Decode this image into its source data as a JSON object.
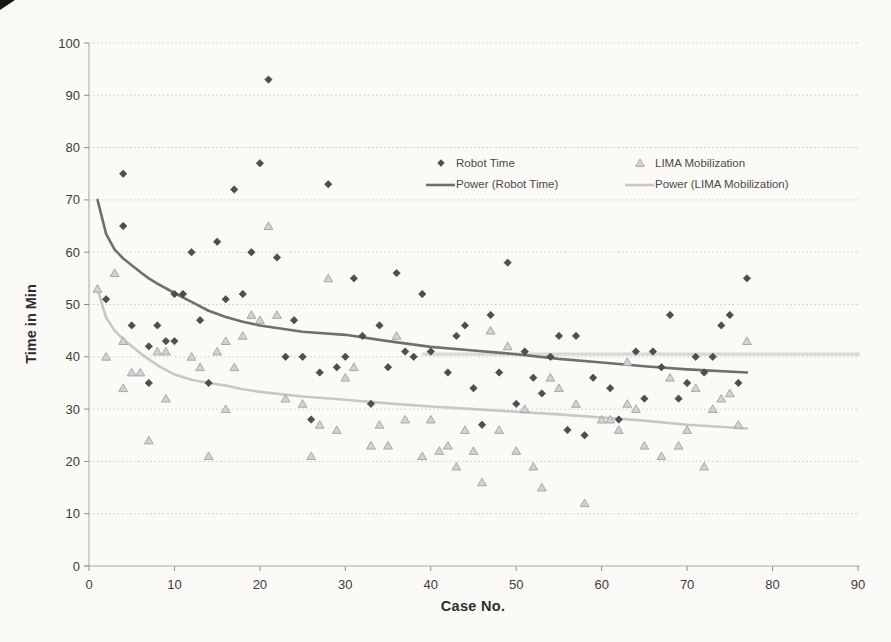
{
  "figure": {
    "background": "#fbfaf7",
    "scan_artifact": "black-corner-wedge-top-left"
  },
  "chart_data": {
    "type": "scatter",
    "title": "",
    "xlabel": "Case No.",
    "ylabel": "Time in Min",
    "xlim": [
      0,
      90
    ],
    "ylim": [
      0,
      100
    ],
    "x_ticks": [
      0,
      10,
      20,
      30,
      40,
      50,
      60,
      70,
      80,
      90
    ],
    "y_ticks": [
      0,
      10,
      20,
      30,
      40,
      50,
      60,
      70,
      80,
      90,
      100
    ],
    "grid": "horizontal-dotted",
    "legend_position": "inside-top-center",
    "series": [
      {
        "name": "Robot Time",
        "kind": "scatter",
        "marker": "diamond",
        "color": "#4e4e4e",
        "edge": "#3e3e3e",
        "points": [
          [
            2,
            51
          ],
          [
            4,
            75
          ],
          [
            4,
            65
          ],
          [
            5,
            46
          ],
          [
            7,
            42
          ],
          [
            7,
            35
          ],
          [
            8,
            46
          ],
          [
            9,
            43
          ],
          [
            10,
            43
          ],
          [
            10,
            52
          ],
          [
            11,
            52
          ],
          [
            12,
            60
          ],
          [
            13,
            47
          ],
          [
            14,
            35
          ],
          [
            15,
            62
          ],
          [
            16,
            51
          ],
          [
            17,
            72
          ],
          [
            18,
            52
          ],
          [
            19,
            60
          ],
          [
            20,
            77
          ],
          [
            21,
            93
          ],
          [
            22,
            59
          ],
          [
            23,
            40
          ],
          [
            24,
            47
          ],
          [
            25,
            40
          ],
          [
            26,
            28
          ],
          [
            27,
            37
          ],
          [
            28,
            73
          ],
          [
            29,
            38
          ],
          [
            30,
            40
          ],
          [
            31,
            55
          ],
          [
            32,
            44
          ],
          [
            33,
            31
          ],
          [
            34,
            46
          ],
          [
            35,
            38
          ],
          [
            36,
            56
          ],
          [
            37,
            41
          ],
          [
            38,
            40
          ],
          [
            39,
            52
          ],
          [
            40,
            41
          ],
          [
            42,
            37
          ],
          [
            43,
            44
          ],
          [
            44,
            46
          ],
          [
            45,
            34
          ],
          [
            46,
            27
          ],
          [
            47,
            48
          ],
          [
            48,
            37
          ],
          [
            49,
            58
          ],
          [
            50,
            31
          ],
          [
            51,
            41
          ],
          [
            52,
            36
          ],
          [
            53,
            33
          ],
          [
            54,
            40
          ],
          [
            55,
            44
          ],
          [
            56,
            26
          ],
          [
            57,
            44
          ],
          [
            58,
            25
          ],
          [
            59,
            36
          ],
          [
            61,
            34
          ],
          [
            62,
            28
          ],
          [
            64,
            41
          ],
          [
            65,
            32
          ],
          [
            66,
            41
          ],
          [
            67,
            38
          ],
          [
            68,
            48
          ],
          [
            69,
            32
          ],
          [
            70,
            35
          ],
          [
            71,
            40
          ],
          [
            72,
            37
          ],
          [
            73,
            40
          ],
          [
            74,
            46
          ],
          [
            75,
            48
          ],
          [
            76,
            35
          ],
          [
            77,
            55
          ]
        ]
      },
      {
        "name": "LIMA Mobilization",
        "kind": "scatter",
        "marker": "triangle",
        "color": "#d2d2d2",
        "edge": "#a2a2a2",
        "points": [
          [
            1,
            53
          ],
          [
            2,
            40
          ],
          [
            3,
            56
          ],
          [
            4,
            43
          ],
          [
            4,
            34
          ],
          [
            5,
            37
          ],
          [
            6,
            37
          ],
          [
            7,
            24
          ],
          [
            8,
            41
          ],
          [
            9,
            41
          ],
          [
            9,
            32
          ],
          [
            12,
            40
          ],
          [
            13,
            38
          ],
          [
            14,
            21
          ],
          [
            15,
            41
          ],
          [
            16,
            43
          ],
          [
            16,
            30
          ],
          [
            17,
            38
          ],
          [
            18,
            44
          ],
          [
            19,
            48
          ],
          [
            20,
            47
          ],
          [
            21,
            65
          ],
          [
            22,
            48
          ],
          [
            23,
            32
          ],
          [
            25,
            31
          ],
          [
            26,
            21
          ],
          [
            27,
            27
          ],
          [
            28,
            55
          ],
          [
            29,
            26
          ],
          [
            30,
            36
          ],
          [
            31,
            38
          ],
          [
            33,
            23
          ],
          [
            34,
            27
          ],
          [
            35,
            23
          ],
          [
            36,
            44
          ],
          [
            37,
            28
          ],
          [
            39,
            21
          ],
          [
            40,
            28
          ],
          [
            41,
            22
          ],
          [
            42,
            23
          ],
          [
            43,
            19
          ],
          [
            44,
            26
          ],
          [
            45,
            22
          ],
          [
            46,
            16
          ],
          [
            47,
            45
          ],
          [
            48,
            26
          ],
          [
            49,
            42
          ],
          [
            50,
            22
          ],
          [
            51,
            30
          ],
          [
            52,
            19
          ],
          [
            53,
            15
          ],
          [
            54,
            36
          ],
          [
            55,
            34
          ],
          [
            57,
            31
          ],
          [
            58,
            12
          ],
          [
            60,
            28
          ],
          [
            61,
            28
          ],
          [
            62,
            26
          ],
          [
            63,
            39
          ],
          [
            63,
            31
          ],
          [
            64,
            30
          ],
          [
            65,
            23
          ],
          [
            67,
            21
          ],
          [
            68,
            36
          ],
          [
            69,
            23
          ],
          [
            70,
            26
          ],
          [
            71,
            34
          ],
          [
            72,
            19
          ],
          [
            73,
            30
          ],
          [
            74,
            32
          ],
          [
            75,
            33
          ],
          [
            76,
            27
          ],
          [
            77,
            43
          ]
        ]
      },
      {
        "name": "Power (Robot Time)",
        "kind": "line",
        "color": "#6f6f6f",
        "width": 2.6,
        "points": [
          [
            1,
            70
          ],
          [
            2,
            63.5
          ],
          [
            3,
            60.5
          ],
          [
            4,
            58.8
          ],
          [
            5,
            57.5
          ],
          [
            6,
            56.2
          ],
          [
            7,
            55
          ],
          [
            8,
            54
          ],
          [
            10,
            52.2
          ],
          [
            12,
            50.5
          ],
          [
            14,
            48.8
          ],
          [
            16,
            47.6
          ],
          [
            18,
            46.7
          ],
          [
            20,
            46
          ],
          [
            25,
            44.8
          ],
          [
            30,
            44.2
          ],
          [
            35,
            43
          ],
          [
            40,
            41.9
          ],
          [
            45,
            41.2
          ],
          [
            50,
            40.5
          ],
          [
            55,
            39.6
          ],
          [
            60,
            38.9
          ],
          [
            65,
            38.2
          ],
          [
            70,
            37.6
          ],
          [
            77,
            37
          ]
        ]
      },
      {
        "name": "Power (LIMA Mobilization)",
        "kind": "line",
        "color": "#c7c7c7",
        "width": 2.6,
        "points": [
          [
            1,
            53
          ],
          [
            2,
            47.5
          ],
          [
            3,
            45
          ],
          [
            4,
            43.4
          ],
          [
            5,
            42
          ],
          [
            6,
            40.7
          ],
          [
            7,
            39.5
          ],
          [
            8,
            38.4
          ],
          [
            10,
            36.6
          ],
          [
            12,
            35.6
          ],
          [
            14,
            35
          ],
          [
            16,
            34.5
          ],
          [
            18,
            33.8
          ],
          [
            20,
            33.3
          ],
          [
            25,
            32.4
          ],
          [
            30,
            31.8
          ],
          [
            35,
            31.1
          ],
          [
            40,
            30.5
          ],
          [
            45,
            30
          ],
          [
            50,
            29.5
          ],
          [
            55,
            29
          ],
          [
            60,
            28.4
          ],
          [
            65,
            27.8
          ],
          [
            70,
            27
          ],
          [
            77,
            26.3
          ]
        ]
      }
    ],
    "legend": [
      {
        "label": "Robot Time",
        "sample": "diamond",
        "sx": 441,
        "sy": 163,
        "tx": 456,
        "ty": 157
      },
      {
        "label": "Power (Robot Time)",
        "sample": "dark-line",
        "sx": 440,
        "sy": 185,
        "tx": 456,
        "ty": 178
      },
      {
        "label": "LIMA Mobilization",
        "sample": "triangle",
        "sx": 640,
        "sy": 163,
        "tx": 655,
        "ty": 157
      },
      {
        "label": "Power (LIMA Mobilization)",
        "sample": "light-line",
        "sx": 639,
        "sy": 185,
        "tx": 655,
        "ty": 178
      }
    ],
    "artifact_line": {
      "y": 40.5,
      "x_start": 39,
      "x_end": 90.2,
      "color": "#d8d8d6"
    },
    "colors": {
      "grid": "#c8c8c8",
      "axis": "#b4b4b4",
      "tick": "#8f8f8f",
      "text": "#3c3c3c"
    },
    "geometry": {
      "left": 89,
      "top": 43,
      "right": 858,
      "bottom": 566
    }
  }
}
